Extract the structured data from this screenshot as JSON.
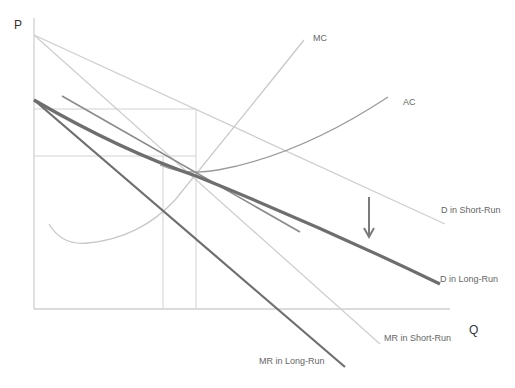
{
  "diagram": {
    "axes": {
      "y_label": "P",
      "x_label": "Q"
    },
    "curves": {
      "mc": {
        "label": "MC",
        "color": "#c8c8c8"
      },
      "ac": {
        "label": "AC",
        "color": "#9a9a9a"
      },
      "d_short_run": {
        "label": "D in Short-Run",
        "color": "#cfcfcf"
      },
      "mr_short_run": {
        "label": "MR in Short-Run",
        "color": "#cfcfcf"
      },
      "d_long_run": {
        "label": "D in Long-Run",
        "color": "#6e6e6e"
      },
      "mr_long_run": {
        "label": "MR in Long-Run",
        "color": "#6e6e6e"
      }
    },
    "annotations": {
      "shift_arrow": "downward-arrow",
      "arrow_color": "#7a7a7a"
    },
    "colors": {
      "axis": "#cfcfcf",
      "guide_lines": "#d2d2d2",
      "background": "#ffffff"
    }
  }
}
